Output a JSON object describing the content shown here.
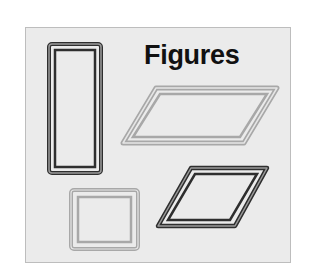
{
  "diagram": {
    "title": "Figures",
    "colors": {
      "page_background": "#ffffff",
      "panel_background": "#ebebeb",
      "panel_border": "#bdbdbd",
      "dark_stroke": "#2e2e2e",
      "light_stroke": "#a8a8a8",
      "title_text": "#111111"
    },
    "shapes": [
      {
        "id": "tall-rectangle",
        "kind": "rectangle",
        "style": "dark-outline-double"
      },
      {
        "id": "wide-parallelogram",
        "kind": "parallelogram",
        "style": "light-outline-double"
      },
      {
        "id": "small-rectangle",
        "kind": "rectangle",
        "style": "light-outline-double"
      },
      {
        "id": "small-parallelogram",
        "kind": "parallelogram",
        "style": "dark-outline-double"
      }
    ]
  }
}
